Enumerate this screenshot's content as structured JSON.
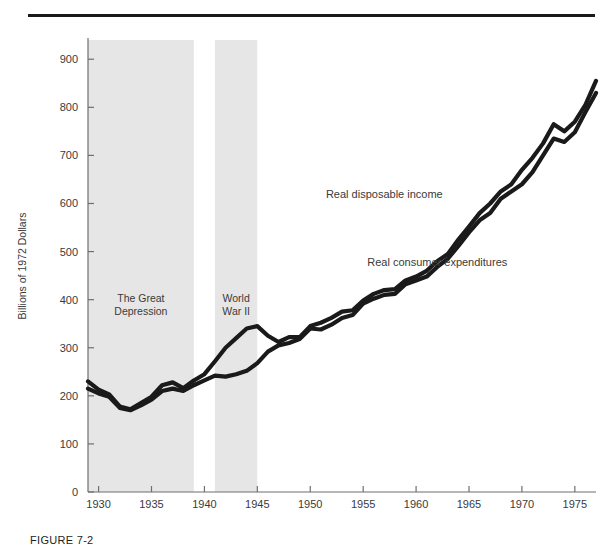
{
  "caption": "FIGURE 7-2",
  "axis": {
    "ylabel": "Billions of 1972 Dollars",
    "yticks": [
      "0",
      "100",
      "200",
      "300",
      "400",
      "500",
      "600",
      "700",
      "800",
      "900"
    ],
    "xticks": [
      "1930",
      "1935",
      "1940",
      "1945",
      "1950",
      "1955",
      "1960",
      "1965",
      "1970",
      "1975"
    ]
  },
  "bands": [
    {
      "label_line1": "The Great",
      "label_line2": "Depression",
      "start": 1929,
      "end": 1939
    },
    {
      "label_line1": "World",
      "label_line2": "War II",
      "start": 1941,
      "end": 1945
    }
  ],
  "series_labels": {
    "income": "Real disposable income",
    "expenditures": "Real consumer expenditures"
  },
  "colors": {
    "line": "#1a1a1a",
    "band": "#e6e6e6",
    "axis": "#6e6e6e",
    "rule": "#1a1a1a",
    "text": "#3a3a3a"
  },
  "chart_data": {
    "type": "line",
    "title": "",
    "xlabel": "",
    "ylabel": "Billions of 1972 Dollars",
    "xlim": [
      1929,
      1977
    ],
    "ylim": [
      0,
      940
    ],
    "grid": false,
    "legend": "inline-annotations",
    "xticks": [
      1930,
      1935,
      1940,
      1945,
      1950,
      1955,
      1960,
      1965,
      1970,
      1975
    ],
    "yticks": [
      0,
      100,
      200,
      300,
      400,
      500,
      600,
      700,
      800,
      900
    ],
    "shaded_regions": [
      {
        "name": "The Great Depression",
        "x0": 1929,
        "x1": 1939
      },
      {
        "name": "World War II",
        "x0": 1941,
        "x1": 1945
      }
    ],
    "x": [
      1929,
      1930,
      1931,
      1932,
      1933,
      1934,
      1935,
      1936,
      1937,
      1938,
      1939,
      1940,
      1941,
      1942,
      1943,
      1944,
      1945,
      1946,
      1947,
      1948,
      1949,
      1950,
      1951,
      1952,
      1953,
      1954,
      1955,
      1956,
      1957,
      1958,
      1959,
      1960,
      1961,
      1962,
      1963,
      1964,
      1965,
      1966,
      1967,
      1968,
      1969,
      1970,
      1971,
      1972,
      1973,
      1974,
      1975,
      1976,
      1977
    ],
    "series": [
      {
        "name": "Real disposable income",
        "values": [
          230,
          213,
          203,
          178,
          172,
          185,
          198,
          222,
          228,
          216,
          232,
          245,
          272,
          300,
          320,
          340,
          345,
          325,
          312,
          322,
          322,
          345,
          352,
          362,
          375,
          378,
          398,
          412,
          420,
          422,
          440,
          448,
          460,
          480,
          495,
          525,
          552,
          580,
          600,
          625,
          640,
          670,
          695,
          725,
          765,
          750,
          770,
          805,
          855
        ],
        "color": "#1a1a1a"
      },
      {
        "name": "Real consumer expenditures",
        "values": [
          215,
          205,
          198,
          175,
          170,
          180,
          192,
          210,
          215,
          210,
          222,
          232,
          242,
          240,
          245,
          252,
          268,
          292,
          305,
          310,
          318,
          340,
          338,
          348,
          362,
          368,
          392,
          402,
          410,
          412,
          432,
          440,
          448,
          468,
          485,
          512,
          540,
          565,
          580,
          610,
          625,
          640,
          665,
          700,
          735,
          728,
          748,
          790,
          830
        ]
      }
    ],
    "annotations": [
      {
        "text": "Real disposable income",
        "x": 1957,
        "y": 612
      },
      {
        "text": "Real consumer expenditures",
        "x": 1962,
        "y": 470
      },
      {
        "text": "The Great Depression",
        "x": 1934,
        "y": 385
      },
      {
        "text": "World War II",
        "x": 1943,
        "y": 385
      }
    ]
  }
}
